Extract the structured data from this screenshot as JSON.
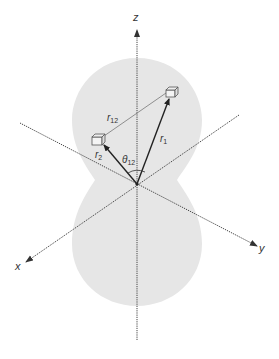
{
  "diagram": {
    "colors": {
      "background": "#ffffff",
      "lobe_fill": "#e6e6e6",
      "axis": "#444444",
      "vector": "#222222",
      "separation_line": "#777777",
      "text": "#333333"
    },
    "axes": {
      "z": {
        "label": "z"
      },
      "x": {
        "label": "x"
      },
      "y": {
        "label": "y"
      }
    },
    "vectors": {
      "r1": {
        "label": "r",
        "subscript": "1"
      },
      "r2": {
        "label": "r",
        "subscript": "2"
      },
      "r12": {
        "label": "r",
        "subscript": "12"
      }
    },
    "angle": {
      "label": "θ",
      "subscript": "12"
    },
    "particles": [
      {
        "name": "particle-1"
      },
      {
        "name": "particle-2"
      }
    ]
  }
}
